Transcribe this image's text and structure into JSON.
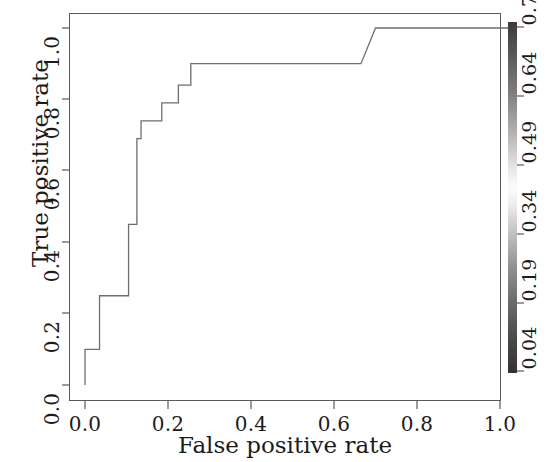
{
  "chart_data": {
    "type": "line",
    "title": "",
    "xlabel": "False positive rate",
    "ylabel": "True positive rate",
    "xlim": [
      -0.03,
      1.03
    ],
    "ylim": [
      -0.03,
      1.03
    ],
    "grid": false,
    "legend_position": "none",
    "xticks": [
      "0.0",
      "0.2",
      "0.4",
      "0.6",
      "0.8",
      "1.0"
    ],
    "xtick_values": [
      0.0,
      0.2,
      0.4,
      0.6,
      0.8,
      1.0
    ],
    "yticks": [
      "0.0",
      "0.2",
      "0.4",
      "0.6",
      "0.8",
      "1.0"
    ],
    "ytick_values": [
      0.0,
      0.2,
      0.4,
      0.6,
      0.8,
      1.0
    ],
    "series": [
      {
        "name": "ROC curve",
        "color": "#6e6e6e",
        "step": "post",
        "x": [
          0.0,
          0.0,
          0.035,
          0.035,
          0.105,
          0.105,
          0.125,
          0.125,
          0.135,
          0.135,
          0.185,
          0.185,
          0.225,
          0.225,
          0.255,
          0.255,
          0.305,
          0.305,
          0.665,
          0.7,
          1.02
        ],
        "y": [
          0.0,
          0.1,
          0.1,
          0.25,
          0.25,
          0.45,
          0.45,
          0.69,
          0.69,
          0.74,
          0.74,
          0.79,
          0.79,
          0.84,
          0.84,
          0.9,
          0.9,
          0.9,
          0.9,
          1.0,
          1.0
        ]
      }
    ],
    "colorbar": {
      "label": "",
      "orientation": "vertical",
      "ticks": [
        "0.79",
        "0.64",
        "0.49",
        "0.34",
        "0.19",
        "0.04"
      ],
      "tick_values": [
        0.79,
        0.64,
        0.49,
        0.34,
        0.19,
        0.04
      ],
      "gradient_description": "grayscale: dark at top, light near middle, dark at bottom",
      "color_top": "#3a3a3a",
      "color_mid": "#fbfbfb",
      "color_bottom": "#333333"
    }
  },
  "axes": {
    "x_title": "False positive rate",
    "y_title": "True positive rate",
    "frame_color": "#5a5a5a",
    "curve_color": "#6e6e6e"
  },
  "xticks": {
    "t0": "0.0",
    "t1": "0.2",
    "t2": "0.4",
    "t3": "0.6",
    "t4": "0.8",
    "t5": "1.0"
  },
  "yticks": {
    "t0": "0.0",
    "t1": "0.2",
    "t2": "0.4",
    "t3": "0.6",
    "t4": "0.8",
    "t5": "1.0"
  },
  "cbticks": {
    "t0": "0.79",
    "t1": "0.64",
    "t2": "0.49",
    "t3": "0.34",
    "t4": "0.19",
    "t5": "0.04"
  }
}
